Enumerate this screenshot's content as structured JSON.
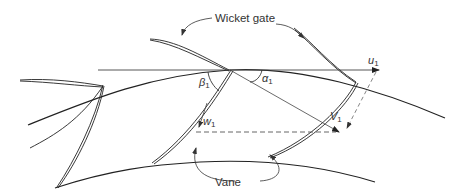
{
  "diagram": {
    "title": "",
    "labels": {
      "wicket_gate": "Wicket gate",
      "vane": "Vane",
      "u_symbol": "u",
      "u_sub": "1",
      "v_symbol": "V",
      "v_sub": "1",
      "w_symbol": "w",
      "w_sub": "1",
      "alpha_symbol": "α",
      "alpha_sub": "1",
      "beta_symbol": "β",
      "beta_sub": "1"
    },
    "colors": {
      "line": "#222222",
      "thin_line": "#555555",
      "dashed": "#555555",
      "text": "#333333",
      "background": "#ffffff"
    },
    "elements": [
      "outer-rotor-arc",
      "inner-rotor-arc",
      "wicket-gate-blades",
      "runner-vanes",
      "velocity-vector-u1",
      "velocity-vector-V1",
      "velocity-vector-w1",
      "angle-alpha1",
      "angle-beta1"
    ]
  }
}
